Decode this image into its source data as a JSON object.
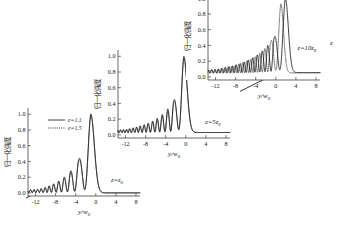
{
  "figure": {
    "background": "#ffffff",
    "ink": "#1a1a1a",
    "propagation_axis_label": "z",
    "axis_x_label": "y/w",
    "axis_x_label_sub": "0",
    "axis_y_label": "归一化强度"
  },
  "legend": {
    "position": "upper-left-of-panel-1",
    "entries": [
      {
        "label": "e=1.1",
        "style": "solid"
      },
      {
        "label": "e=1.5",
        "style": "dotted"
      }
    ]
  },
  "panels": [
    {
      "id": "panel-z0",
      "z_label": "z=z",
      "z_label_sub": "0"
    },
    {
      "id": "panel-z5",
      "z_label": "z=5z",
      "z_label_sub": "0"
    },
    {
      "id": "panel-z10",
      "z_label": "z=10z",
      "z_label_sub": "0"
    }
  ],
  "chart_data": {
    "type": "line",
    "title": "",
    "subtitle": "",
    "xlabel": "y/w0",
    "ylabel": "归一化强度 (normalized intensity)",
    "xlim": [
      -13.5,
      8.8
    ],
    "ylim": [
      -0.04,
      1.08
    ],
    "xticks": [
      -12,
      -8,
      -4,
      0,
      4,
      8
    ],
    "xticklabels": [
      "-12",
      "-8",
      "-4",
      "0",
      "4",
      "8"
    ],
    "yticks": [
      0.0,
      0.2,
      0.4,
      0.6,
      0.8,
      1.0
    ],
    "yticklabels": [
      "0.0",
      "0.2",
      "0.4",
      "0.6",
      "0.8",
      "1.0"
    ],
    "grid": false,
    "legend_position": "upper left",
    "legend_entries": [
      "e=1.1",
      "e=1.5"
    ],
    "annotations": [
      {
        "text": "z=z0",
        "panel": 0
      },
      {
        "text": "z=5z0",
        "panel": 1
      },
      {
        "text": "z=10z0",
        "panel": 2
      },
      {
        "text": "z",
        "role": "propagation-arrow"
      }
    ],
    "panels": [
      {
        "name": "z=z0",
        "series": [
          {
            "name": "e=1.1",
            "style": "solid",
            "main_peak_x": -1.0,
            "main_peak_y": 1.0,
            "pedestal": 0.0,
            "decay_width": 1.25,
            "lobe_peaks_x": [
              -3.4,
              -5.0,
              -6.3,
              -7.4,
              -8.4,
              -9.3,
              -10.1,
              -10.9,
              -11.6
            ],
            "lobe_peaks_y": [
              0.42,
              0.28,
              0.2,
              0.15,
              0.115,
              0.09,
              0.07,
              0.055,
              0.045
            ]
          },
          {
            "name": "e=1.5",
            "style": "dotted",
            "main_peak_x": -1.0,
            "main_peak_y": 1.0,
            "pedestal": 0.0,
            "decay_width": 1.25,
            "lobe_peaks_x": [
              -3.4,
              -5.0,
              -6.3,
              -7.4,
              -8.4,
              -9.3,
              -10.1,
              -10.9,
              -11.6
            ],
            "lobe_peaks_y": [
              0.4,
              0.26,
              0.185,
              0.14,
              0.105,
              0.085,
              0.065,
              0.05,
              0.04
            ]
          }
        ]
      },
      {
        "name": "z=5z0",
        "series": [
          {
            "name": "e=1.1",
            "style": "solid",
            "main_peak_x": -0.4,
            "main_peak_y": 1.0,
            "pedestal": 0.03,
            "decay_width": 1.15,
            "lobe_peaks_x": [
              -2.4,
              -3.6,
              -4.7,
              -5.7,
              -6.6,
              -7.5,
              -8.3,
              -9.1,
              -9.8,
              -10.5,
              -11.2,
              -11.8
            ],
            "lobe_peaks_y": [
              0.43,
              0.33,
              0.26,
              0.21,
              0.175,
              0.15,
              0.13,
              0.115,
              0.1,
              0.09,
              0.08,
              0.07
            ]
          },
          {
            "name": "e=1.5",
            "style": "dotted",
            "main_peak_x": -0.4,
            "main_peak_y": 0.98,
            "pedestal": 0.03,
            "decay_width": 1.15,
            "lobe_peaks_x": [
              -2.4,
              -3.6,
              -4.7,
              -5.7,
              -6.6,
              -7.5,
              -8.3,
              -9.1,
              -9.8,
              -10.5,
              -11.2,
              -11.8
            ],
            "lobe_peaks_y": [
              0.4,
              0.3,
              0.24,
              0.195,
              0.165,
              0.14,
              0.12,
              0.105,
              0.095,
              0.085,
              0.075,
              0.065
            ]
          }
        ]
      },
      {
        "name": "z=10z0",
        "series": [
          {
            "name": "e=1.1",
            "style": "solid",
            "main_peak_x": 1.9,
            "main_peak_y": 1.0,
            "pedestal": 0.055,
            "decay_width": 1.05,
            "lobe_peaks_x": [
              -0.3,
              -1.6,
              -2.7,
              -3.7,
              -4.6,
              -5.5,
              -6.3,
              -7.1,
              -7.9,
              -8.6,
              -9.3,
              -10.0,
              -10.7,
              -11.4
            ],
            "lobe_peaks_y": [
              0.5,
              0.4,
              0.33,
              0.28,
              0.245,
              0.215,
              0.19,
              0.17,
              0.155,
              0.14,
              0.13,
              0.12,
              0.11,
              0.1
            ]
          },
          {
            "name": "e=1.5",
            "style": "dotted",
            "main_peak_x": 1.0,
            "main_peak_y": 0.93,
            "pedestal": 0.05,
            "decay_width": 0.95,
            "lobe_peaks_x": [
              -1.0,
              -2.2,
              -3.2,
              -4.1,
              -5.0,
              -5.8,
              -6.6,
              -7.4,
              -8.1,
              -8.8,
              -9.5,
              -10.2,
              -10.9,
              -11.5
            ],
            "lobe_peaks_y": [
              0.45,
              0.36,
              0.3,
              0.255,
              0.225,
              0.2,
              0.18,
              0.16,
              0.145,
              0.135,
              0.125,
              0.115,
              0.105,
              0.095
            ]
          }
        ]
      }
    ]
  }
}
